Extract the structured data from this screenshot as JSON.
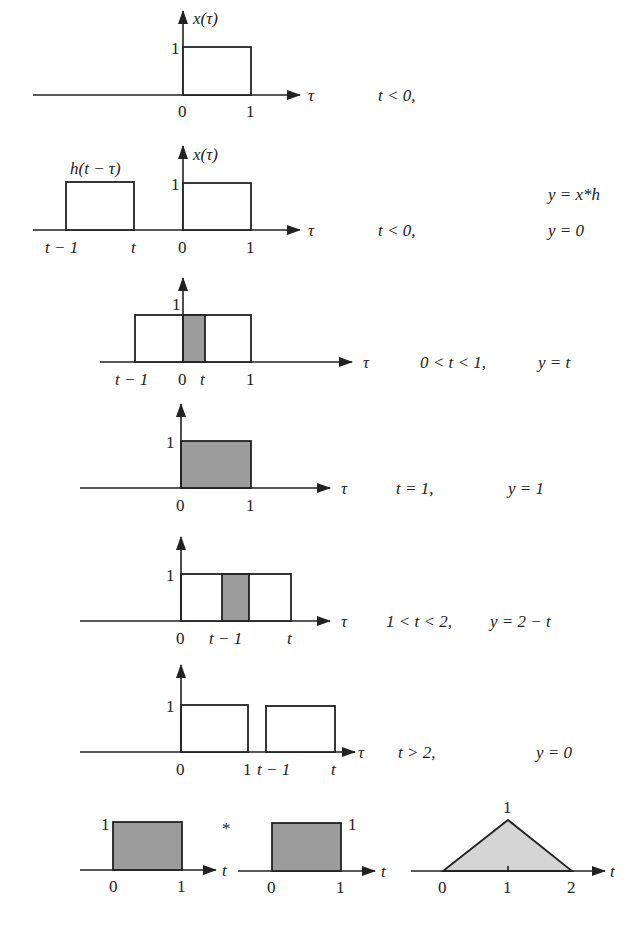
{
  "figure": {
    "panels": [
      {
        "id": "p1",
        "signal_label": "x(τ)",
        "axis_var": "τ",
        "ticks": [
          "0",
          "1"
        ],
        "height_label": "1",
        "condition": "t < 0,",
        "result": ""
      },
      {
        "id": "p2",
        "signal_label": "x(τ)",
        "kernel_label": "h(t − τ)",
        "axis_var": "τ",
        "ticks": [
          "t − 1",
          "t",
          "0",
          "1"
        ],
        "height_label": "1",
        "condition": "t < 0,",
        "result_header": "y = x*h",
        "result": "y = 0"
      },
      {
        "id": "p3",
        "axis_var": "τ",
        "ticks": [
          "t − 1",
          "0",
          "t",
          "1"
        ],
        "height_label": "1",
        "condition": "0 < t < 1,",
        "result": "y = t"
      },
      {
        "id": "p4",
        "axis_var": "τ",
        "ticks": [
          "0",
          "1"
        ],
        "height_label": "1",
        "condition": "t = 1,",
        "result": "y = 1"
      },
      {
        "id": "p5",
        "axis_var": "τ",
        "ticks": [
          "0",
          "t − 1",
          "t"
        ],
        "height_label": "1",
        "condition": "1 < t < 2,",
        "result": "y = 2 − t"
      },
      {
        "id": "p6",
        "axis_var": "τ",
        "ticks": [
          "0",
          "1",
          "t − 1",
          "t"
        ],
        "height_label": "1",
        "condition": "t > 2,",
        "result": "y = 0"
      }
    ],
    "summary": {
      "operator": "*",
      "left": {
        "axis_var": "t",
        "ticks": [
          "0",
          "1"
        ],
        "height_label": "1"
      },
      "right": {
        "axis_var": "t",
        "ticks": [
          "0",
          "1"
        ],
        "height_label": "1"
      },
      "result": {
        "axis_var": "t",
        "ticks": [
          "0",
          "1",
          "2"
        ],
        "peak_label": "1"
      }
    },
    "colors": {
      "ink": "#222222",
      "overlap_fill": "#9c9c9c",
      "triangle_fill": "#d4d4d4",
      "background": "#ffffff"
    }
  }
}
